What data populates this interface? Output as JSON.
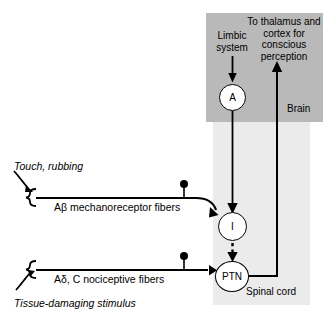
{
  "figure": {
    "regions": [
      {
        "name": "Brain",
        "label": "Brain",
        "fill": "#b9b9b9"
      },
      {
        "name": "Spinal cord",
        "label": "Spinal cord",
        "fill": "#ebebeb"
      }
    ],
    "nodes": [
      {
        "id": "A",
        "label": "A",
        "meaning": "affective nucleus"
      },
      {
        "id": "I",
        "label": "I",
        "meaning": "inhibitory interneuron"
      },
      {
        "id": "PTN",
        "label": "PTN",
        "meaning": "pain transmission neuron"
      }
    ],
    "labels": {
      "limbic_system": "Limbic\nsystem",
      "to_thalamus": "To thalamus and\ncortex for\nconscious\nperception",
      "brain": "Brain",
      "spinal_cord": "Spinal cord",
      "touch_rubbing": "Touch, rubbing",
      "tissue_damaging": "Tissue-damaging stimulus",
      "abeta_fibers": "Aβ mechanoreceptor fibers",
      "adelta_fibers": "Aδ, C nociceptive fibers"
    },
    "colors": {
      "brain_fill": "#b9b9b9",
      "spinal_fill": "#ebebeb",
      "stroke": "#000000",
      "node_fill": "#ffffff",
      "page_background": "#ffffff"
    },
    "connections": [
      {
        "from": "Limbic system",
        "to": "A",
        "style": "solid-arrow",
        "direction": "down"
      },
      {
        "from": "A",
        "to": "I",
        "style": "solid-line",
        "direction": "down"
      },
      {
        "from": "Aβ mechanoreceptor fibers",
        "to": "I",
        "style": "solid-arrow",
        "direction": "right"
      },
      {
        "from": "I",
        "to": "PTN",
        "style": "dashed-arrow",
        "direction": "down"
      },
      {
        "from": "Aδ, C nociceptive fibers",
        "to": "PTN",
        "style": "solid-arrow",
        "direction": "right"
      },
      {
        "from": "PTN",
        "to": "To thalamus and cortex for conscious perception",
        "style": "solid-arrow",
        "direction": "up"
      }
    ]
  }
}
